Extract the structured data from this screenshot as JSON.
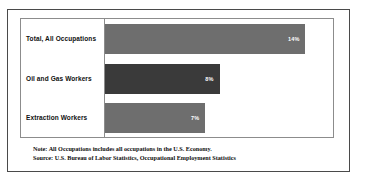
{
  "figure": {
    "frame_color": "#4a4a4a",
    "plot_frame_color": "#8c8c8c",
    "background": "#ffffff"
  },
  "chart_data": {
    "type": "bar",
    "orientation": "horizontal",
    "title": "",
    "subtitle": "",
    "xlabel": "",
    "ylabel": "",
    "grid": false,
    "legend": false,
    "xlim": [
      0,
      16
    ],
    "categories": [
      "Total, All Occupations",
      "Oil and Gas Workers",
      "Extraction Workers"
    ],
    "values": [
      14,
      8,
      7
    ],
    "value_labels": [
      "14%",
      "8%",
      "7%"
    ],
    "bar_colors": [
      "#6e6e6e",
      "#3a3a3a",
      "#6e6e6e"
    ],
    "value_label_color": "#ffffff",
    "bars": [
      {
        "category": "Total, All Occupations",
        "value": 14,
        "label": "14%",
        "color": "#6e6e6e"
      },
      {
        "category": "Oil and Gas Workers",
        "value": 8,
        "label": "8%",
        "color": "#3a3a3a"
      },
      {
        "category": "Extraction Workers",
        "value": 7,
        "label": "7%",
        "color": "#6e6e6e"
      }
    ],
    "annotations": [
      "Note: All Occupations includes all occupations in the U.S. Economy.",
      "Source: U.S. Bureau of Labor Statistics, Occupational Employment Statistics"
    ]
  },
  "footnotes": {
    "note": "Note: All Occupations includes all occupations in the U.S. Economy.",
    "source": "Source: U.S. Bureau of Labor Statistics, Occupational Employment Statistics"
  }
}
